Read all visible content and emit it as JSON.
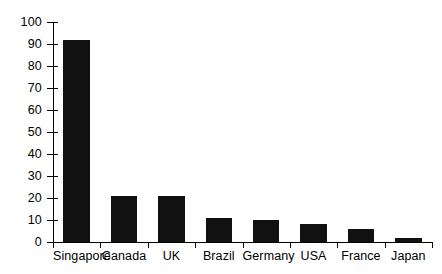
{
  "chart_data": {
    "type": "bar",
    "title": "",
    "subtitle": "",
    "xlabel": "",
    "ylabel": "",
    "categories": [
      "Singapore",
      "Canada",
      "UK",
      "Brazil",
      "Germany",
      "USA",
      "France",
      "Japan"
    ],
    "values": [
      92,
      21,
      21,
      11,
      10,
      8,
      6,
      2
    ],
    "ylim": [
      0,
      100
    ],
    "ytick_step": 10,
    "yticks": [
      0,
      10,
      20,
      30,
      40,
      50,
      60,
      70,
      80,
      90,
      100
    ],
    "ytick_labels": [
      "0",
      "10",
      "20",
      "30",
      "40",
      "50",
      "60",
      "70",
      "80",
      "90",
      "100"
    ],
    "grid": false,
    "legend": false,
    "legend_position": "none",
    "bar_color": "#111111",
    "axis_color": "#000000",
    "background_color": "#ffffff"
  }
}
